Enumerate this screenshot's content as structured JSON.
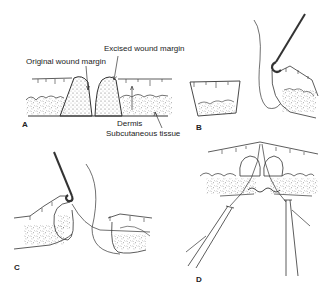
{
  "figure": {
    "panels": [
      {
        "id": "A",
        "label": "A"
      },
      {
        "id": "B",
        "label": "B"
      },
      {
        "id": "C",
        "label": "C"
      },
      {
        "id": "D",
        "label": "D"
      }
    ],
    "annotations": {
      "excised_wound_margin": "Excised wound margin",
      "original_wound_margin": "Original wound margin",
      "dermis": "Dermis",
      "subcutaneous_tissue": "Subcutaneous tissue"
    },
    "colors": {
      "line": "#333333",
      "background": "#ffffff",
      "stipple": "#555555"
    }
  }
}
